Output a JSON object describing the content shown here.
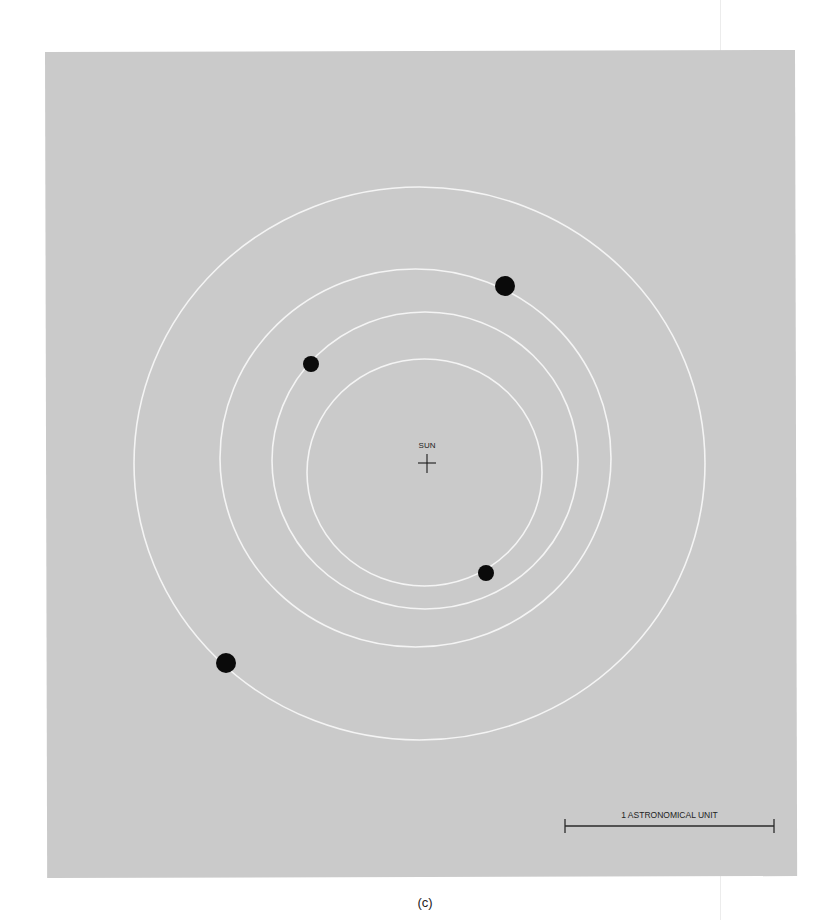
{
  "figure": {
    "caption": "(c)",
    "background_color": "#cacaca",
    "orbit_color": "#f4f4f4",
    "planet_color": "#0a0a0a"
  },
  "sun": {
    "label": "SUN",
    "x": 427,
    "y": 463
  },
  "orbits": [
    {
      "name": "orbit-1",
      "cx": 424.5,
      "cy": 472.5,
      "rx": 117.5,
      "ry": 113.5
    },
    {
      "name": "orbit-2",
      "cx": 425,
      "cy": 460.5,
      "rx": 153,
      "ry": 148.5
    },
    {
      "name": "orbit-3",
      "cx": 415.5,
      "cy": 458,
      "rx": 195.5,
      "ry": 189
    },
    {
      "name": "orbit-4",
      "cx": 419.5,
      "cy": 463.5,
      "rx": 285.5,
      "ry": 276.5
    }
  ],
  "planets": [
    {
      "name": "planet-1",
      "x": 486,
      "y": 573,
      "r": 8
    },
    {
      "name": "planet-2",
      "x": 311,
      "y": 364,
      "r": 8
    },
    {
      "name": "planet-3",
      "x": 505,
      "y": 286,
      "r": 10
    },
    {
      "name": "planet-4",
      "x": 226,
      "y": 663,
      "r": 10
    }
  ],
  "scale_bar": {
    "label": "1 ASTRONOMICAL UNIT",
    "x1": 565,
    "x2": 774,
    "y": 826
  }
}
